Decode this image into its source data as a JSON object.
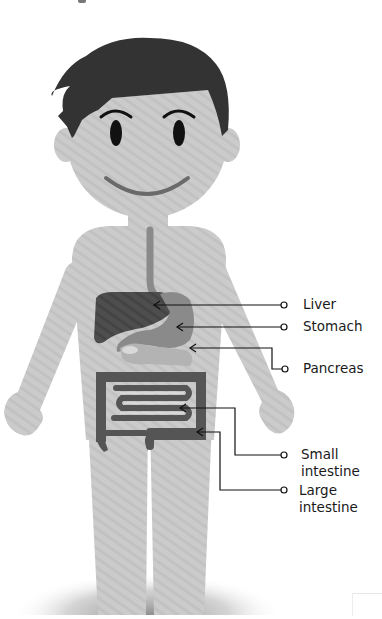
{
  "diagram": {
    "type": "labeled-anatomy-illustration",
    "colors": {
      "skin": "#c9c9c9",
      "hair": "#333333",
      "eyes": "#111111",
      "mouth": "#6a6a6a",
      "liver": "#4a4a4a",
      "stomach": "#8a8a8a",
      "pancreas": "#b0b0b0",
      "small_intestine": "#555555",
      "large_intestine": "#555555",
      "leader_line": "#111111",
      "label_text": "#1a1a1a",
      "background": "#ffffff"
    },
    "labels": [
      {
        "id": "liver",
        "text": "Liver"
      },
      {
        "id": "stomach",
        "text": "Stomach"
      },
      {
        "id": "pancreas",
        "text": "Pancreas"
      },
      {
        "id": "small_intestine",
        "line1": "Small",
        "line2": "intestine"
      },
      {
        "id": "large_intestine",
        "line1": "Large",
        "line2": "intestine"
      }
    ]
  }
}
